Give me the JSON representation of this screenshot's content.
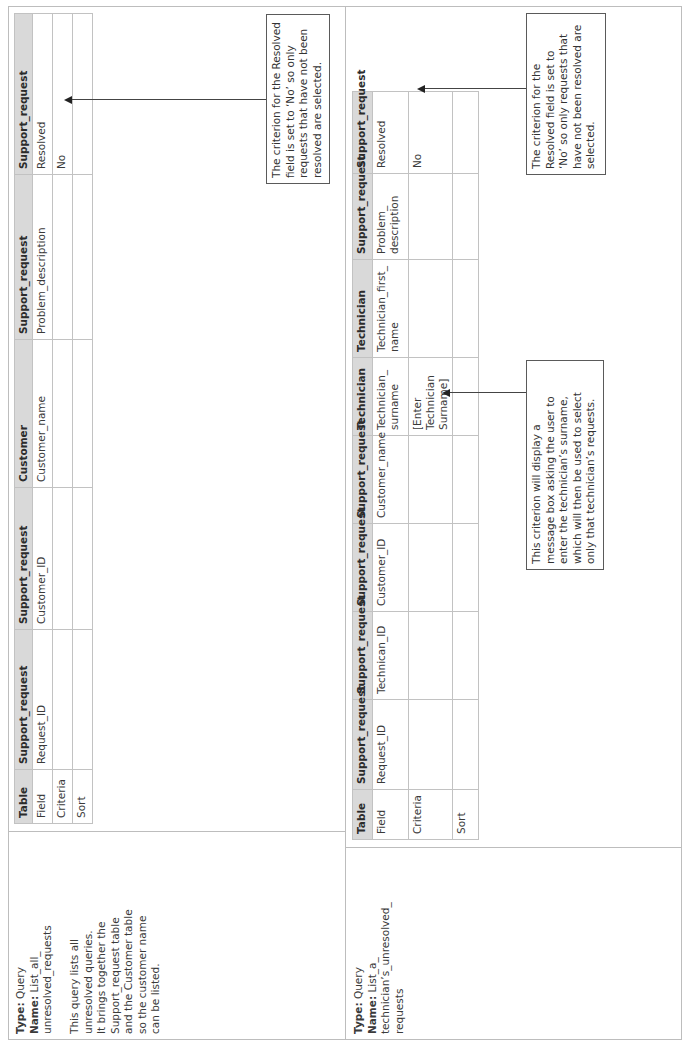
{
  "queries": [
    {
      "type_label": "Type:",
      "type_value": "Query",
      "name_label": "Name:",
      "name_value_lines": [
        "List_all_",
        "unresolved_requests"
      ],
      "description_lines": [
        "This query lists all",
        "unresolved queries.",
        "It brings together the",
        "Support_request table",
        "and the Customer table",
        "so the customer name",
        "can be listed."
      ],
      "table": {
        "row_labels": [
          "Table",
          "Field",
          "Criteria",
          "Sort"
        ],
        "columns": [
          {
            "table": "Support_request",
            "field": "Request_ID",
            "criteria": "",
            "sort": ""
          },
          {
            "table": "Support_request",
            "field": "Customer_ID",
            "criteria": "",
            "sort": ""
          },
          {
            "table": "Customer",
            "field": "Customer_name",
            "criteria": "",
            "sort": ""
          },
          {
            "table": "Support_request",
            "field": "Problem_description",
            "criteria": "",
            "sort": ""
          },
          {
            "table": "Support_request",
            "field": "Resolved",
            "criteria": "No",
            "sort": ""
          }
        ]
      },
      "callouts": [
        {
          "text_lines": [
            "The criterion for the Resolved",
            "field is set to ‘No’ so only",
            "requests that have not been",
            "resolved are selected."
          ],
          "points_to": "Resolved criteria"
        }
      ]
    },
    {
      "type_label": "Type:",
      "type_value": "Query",
      "name_label": "Name:",
      "name_value_lines": [
        "List_a_",
        "technician’s_unresolved_",
        "requests"
      ],
      "description_lines": [],
      "table": {
        "row_labels": [
          "Table",
          "Field",
          "Criteria",
          "Sort"
        ],
        "columns": [
          {
            "table": "Support_request",
            "field_lines": [
              "Request_ID"
            ],
            "criteria_lines": [],
            "sort": ""
          },
          {
            "table": "Support_request",
            "field_lines": [
              "Technican_ID"
            ],
            "criteria_lines": [],
            "sort": ""
          },
          {
            "table": "Support_request",
            "field_lines": [
              "Customer_ID"
            ],
            "criteria_lines": [],
            "sort": ""
          },
          {
            "table": "Support_request",
            "field_lines": [
              "Customer_name"
            ],
            "criteria_lines": [],
            "sort": ""
          },
          {
            "table": "Technician",
            "field_lines": [
              "Technician_",
              "surname"
            ],
            "criteria_lines": [
              "[Enter Technician",
              "Surname]"
            ],
            "sort": ""
          },
          {
            "table": "Technician",
            "field_lines": [
              "Technician_first_",
              "name"
            ],
            "criteria_lines": [],
            "sort": ""
          },
          {
            "table": "Support_request",
            "field_lines": [
              "Problem_",
              "description"
            ],
            "criteria_lines": [],
            "sort": ""
          },
          {
            "table": "Support_request",
            "field_lines": [
              "Resolved"
            ],
            "criteria_lines": [
              "No"
            ],
            "sort": ""
          }
        ]
      },
      "callouts": [
        {
          "text_lines": [
            "This criterion will display a",
            "message box asking the user to",
            "enter the technician’s surname,",
            "which will then be used to select",
            "only that technician’s requests."
          ],
          "points_to": "Technician_surname criteria"
        },
        {
          "text_lines": [
            "The criterion for the",
            "Resolved field is set to",
            "‘No’ so only requests that",
            "have not been resolved are",
            "selected."
          ],
          "points_to": "Resolved criteria"
        }
      ]
    }
  ],
  "colors": {
    "header_bg": "#d9d9d9",
    "grid_line": "#c2c2c2",
    "callout_border": "#5a5a5a"
  }
}
